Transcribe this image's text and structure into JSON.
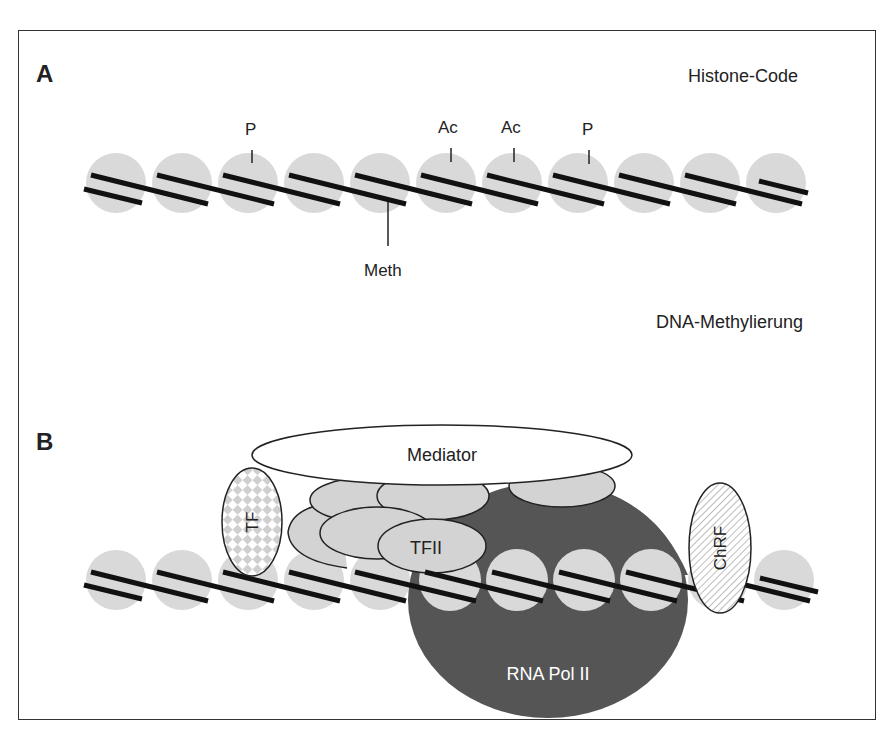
{
  "figure": {
    "panel_a": {
      "letter": "A",
      "title": "Histone-Code",
      "subtitle": "DNA-Methylierung",
      "nucleosome_count": 11,
      "modifications": [
        {
          "label": "P",
          "nucleosome": 3,
          "position": "above"
        },
        {
          "label": "Ac",
          "nucleosome": 6,
          "position": "above"
        },
        {
          "label": "Ac",
          "nucleosome": 7,
          "position": "above"
        },
        {
          "label": "P",
          "nucleosome": 8,
          "position": "above"
        },
        {
          "label": "Meth",
          "nucleosome": 5,
          "position": "below"
        }
      ]
    },
    "panel_b": {
      "letter": "B",
      "mediator": "Mediator",
      "tf": "TF",
      "tfii": "TFII",
      "chrf": "ChRF",
      "rna_pol": "RNA Pol II",
      "nucleosome_count": 11
    },
    "colors": {
      "nucleosome": "#d9d9d9",
      "dna": "#111111",
      "rna_pol": "#555555",
      "gtf": "#d3d3d3",
      "outline": "#222222",
      "frame": "#333333"
    }
  }
}
